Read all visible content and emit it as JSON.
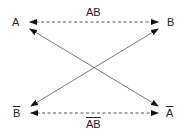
{
  "diagram": {
    "colors": {
      "line": "#444444",
      "arrow": "#111111",
      "text": "#222222",
      "background": "#ffffff"
    },
    "nodes": {
      "top_left": {
        "label": "A",
        "negated": false
      },
      "top_right": {
        "label": "B",
        "negated": false
      },
      "bottom_left": {
        "label": "B",
        "negated": true
      },
      "bottom_right": {
        "label": "A",
        "negated": true
      }
    },
    "edges": {
      "top": {
        "label": "AB",
        "style": "dashed",
        "direction": "bidirectional",
        "from": "A",
        "to": "B"
      },
      "bottom": {
        "label_parts": [
          "A",
          "B"
        ],
        "negated": true,
        "style": "dashed",
        "direction": "bidirectional",
        "from": "B̄",
        "to": "Ā"
      },
      "diagonal_1": {
        "style": "solid",
        "from": "B̄",
        "to": "B",
        "direction": "bidirectional"
      },
      "diagonal_2": {
        "style": "solid",
        "from": "A",
        "to": "Ā",
        "direction": "bidirectional"
      }
    }
  }
}
